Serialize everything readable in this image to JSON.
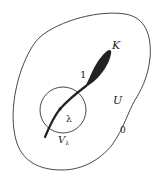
{
  "diagram": {
    "labels": {
      "K": "K",
      "one": "1",
      "lambda": "λ",
      "V": "V",
      "V_sub": "λ",
      "U": "U",
      "zero": "0"
    },
    "colors": {
      "stroke": "#333333",
      "fill": "#222222",
      "background": "#ffffff"
    }
  }
}
